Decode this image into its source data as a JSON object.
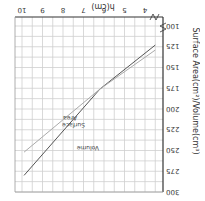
{
  "chart_data": {
    "type": "line",
    "title": "",
    "xlabel": "h(cm)",
    "ylabel": "Surface Area(cm²)/Volume(cm³)",
    "x_ticks": [
      4,
      5,
      6,
      7,
      8,
      9,
      10
    ],
    "y_ticks": [
      100,
      125,
      150,
      175,
      200,
      225,
      250,
      275,
      300
    ],
    "xlim": [
      3.4,
      10.1
    ],
    "ylim": [
      92,
      300
    ],
    "grid": true,
    "axis_break": {
      "x": true,
      "y": true
    },
    "orientation": "rotated 180°",
    "series": [
      {
        "name": "Volume",
        "color": "#555555",
        "x": [
          3.5,
          6.2,
          9.9
        ],
        "y": [
          123,
          176,
          280
        ]
      },
      {
        "name": "Surface Area",
        "color": "#aaaaaa",
        "x": [
          3.5,
          6.2,
          9.9
        ],
        "y": [
          129,
          176,
          252
        ]
      }
    ],
    "annotations": [
      {
        "text": "Volume",
        "x": 7.5,
        "y": 250
      },
      {
        "text": "Surface Area",
        "x": 8.2,
        "y": 212
      }
    ]
  },
  "labels": {
    "xlabel": "h(cm)",
    "ylabel": "Surface Area(cm²)/Volume(cm³)",
    "volume": "Volume",
    "surface": "Surface",
    "area": "Area"
  }
}
